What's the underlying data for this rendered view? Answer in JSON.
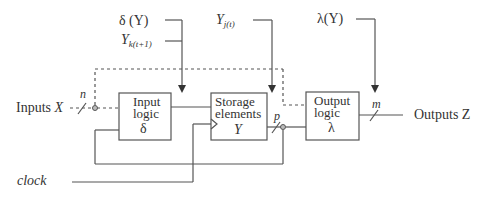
{
  "diagram": {
    "type": "sequential-circuit-block-diagram",
    "blocks": {
      "input_logic": {
        "line1": "Input",
        "line2": "logic",
        "symbol": "δ"
      },
      "storage": {
        "line1": "Storage",
        "line2": "elements",
        "symbol": "Y"
      },
      "output_logic": {
        "line1": "Output",
        "line2": "logic",
        "symbol": "λ"
      }
    },
    "labels": {
      "inputs_prefix": "Inputs ",
      "inputs_var": "X",
      "outputs": "Outputs Z",
      "clock": "clock",
      "n": "n",
      "p": "p",
      "m": "m",
      "delta_y": "δ (Y)",
      "y_next_base": "Y",
      "y_next_sub": "k(t+1)",
      "y_cur_base": "Y",
      "y_cur_sub": "j(t)",
      "lambda_y": "λ(Y)"
    }
  }
}
